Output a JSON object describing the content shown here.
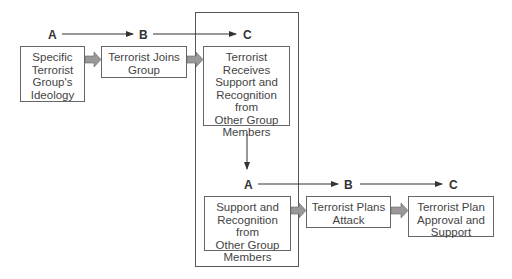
{
  "diagram": {
    "row1": {
      "labels": [
        "A",
        "B",
        "C"
      ],
      "boxes": [
        {
          "text": "Specific Terrorist Group's Ideology",
          "lines": [
            "Specific",
            "Terrorist",
            "Group's",
            "Ideology"
          ]
        },
        {
          "text": "Terrorist Joins Group",
          "lines": [
            "Terrorist Joins",
            "Group"
          ]
        },
        {
          "text": "Terrorist Receives Support and Recognition from Other Group Members",
          "lines": [
            "Terrorist",
            "Receives",
            "Support and",
            "Recognition from",
            "Other Group",
            "Members"
          ]
        }
      ]
    },
    "row2": {
      "labels": [
        "A",
        "B",
        "C"
      ],
      "boxes": [
        {
          "text": "Support and Recognition from Other Group Members",
          "lines": [
            "Support and",
            "Recognition from",
            "Other Group",
            "Members"
          ]
        },
        {
          "text": "Terrorist Plans Attack",
          "lines": [
            "Terrorist Plans",
            "Attack"
          ]
        },
        {
          "text": "Terrorist Plan Approval and Support",
          "lines": [
            "Terrorist Plan",
            "Approval and",
            "Support"
          ]
        }
      ]
    },
    "colors": {
      "box_border": "#666666",
      "block_arrow": "#999999",
      "line": "#333333"
    }
  }
}
